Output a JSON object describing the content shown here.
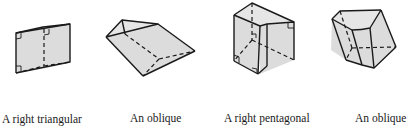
{
  "figures": [
    {
      "id": "right-triangular-prism",
      "caption_line1": "A right triangular",
      "caption_line2": "prism",
      "caption_line3": ""
    },
    {
      "id": "oblique-triangular-prism",
      "caption_line1": "An oblique",
      "caption_line2": "triangular",
      "caption_line3": "prism"
    },
    {
      "id": "right-pentagonal-prism-nonconvex",
      "caption_line1": "A right pentagonal",
      "caption_line2": "prism (nonconvex)",
      "caption_line3": ""
    },
    {
      "id": "oblique-pentagonal-prism",
      "caption_line1": "An oblique",
      "caption_line2": "pentagonal",
      "caption_line3": "prism"
    }
  ],
  "colors": {
    "face_fill": "#dcdcdc",
    "edge": "#1a1a1a",
    "background": "#ffffff"
  }
}
